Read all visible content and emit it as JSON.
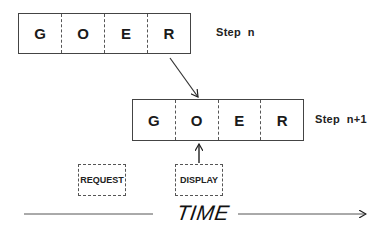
{
  "diagram": {
    "step_n": {
      "label": "Step  n",
      "cells": [
        "G",
        "O",
        "E",
        "R"
      ]
    },
    "step_n_plus_1": {
      "label": "Step  n+1",
      "cells": [
        "G",
        "O",
        "E",
        "R"
      ]
    },
    "tags": {
      "request": "REQUEST",
      "display": "DISPLAY"
    },
    "timeline": {
      "label": "TIME"
    },
    "colors": {
      "stroke": "#444444",
      "text": "#1a1a1a",
      "background": "#ffffff"
    }
  }
}
